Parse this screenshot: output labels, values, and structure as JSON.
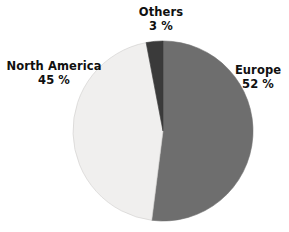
{
  "chart_data": {
    "type": "pie",
    "title": "",
    "subtitle": "",
    "xlabel": "",
    "ylabel": "",
    "grid": false,
    "legend_position": "none",
    "labels_position": "outside",
    "unit": "%",
    "start_angle_deg": 0,
    "direction": "clockwise",
    "categories": [
      "Europe",
      "North America",
      "Others"
    ],
    "values": [
      52,
      45,
      3
    ],
    "colors": [
      "#6e6e6e",
      "#f0efee",
      "#3a3a3a"
    ],
    "slices": [
      {
        "name": "Europe",
        "value": 52,
        "value_text": "52 %",
        "color": "#6e6e6e",
        "start_deg": 0,
        "end_deg": 187.2
      },
      {
        "name": "North America",
        "value": 45,
        "value_text": "45 %",
        "color": "#f0efee",
        "start_deg": 187.2,
        "end_deg": 349.2
      },
      {
        "name": "Others",
        "value": 3,
        "value_text": "3 %",
        "color": "#3a3a3a",
        "start_deg": 349.2,
        "end_deg": 360
      }
    ]
  },
  "labels": {
    "others": {
      "name": "Others",
      "value_text": "3 %"
    },
    "north_america": {
      "name": "North America",
      "value_text": "45 %"
    },
    "europe": {
      "name": "Europe",
      "value_text": "52 %"
    }
  },
  "geometry": {
    "center_x": 163,
    "center_y": 131,
    "radius": 90
  },
  "palette": {
    "background": "#ffffff",
    "text": "#101010",
    "europe": "#6e6e6e",
    "north_america": "#f0efee",
    "others": "#3a3a3a",
    "outline": "#cfcdcb"
  }
}
